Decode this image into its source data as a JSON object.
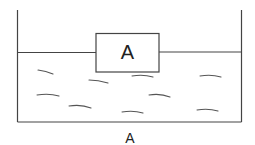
{
  "diagram": {
    "block_label": "A",
    "caption": "A",
    "stroke_color": "#444444",
    "ripple_count": 10
  }
}
